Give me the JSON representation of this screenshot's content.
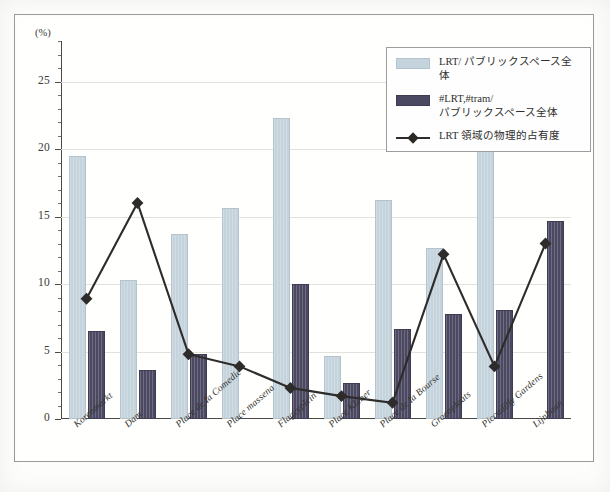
{
  "figure": {
    "y_unit_label": "(%)"
  },
  "legend": {
    "items": [
      {
        "key": "light-bar",
        "swatch": "light",
        "line1": "LRT/ パブリックスペース全体",
        "line2": ""
      },
      {
        "key": "dark-bar",
        "swatch": "dark",
        "line1": "#LRT,#tram/",
        "line2": "パブリックスペース全体"
      },
      {
        "key": "line-series",
        "swatch": "line",
        "line1": "LRT 領域の物理的占有度",
        "line2": ""
      }
    ]
  },
  "colors": {
    "light_bar": "#c5d3dc",
    "dark_bar": "#4b4861",
    "line": "#2e2c2a",
    "grid": "#e2e2dc",
    "axis": "#4a4a48",
    "frame": "#9a9a96"
  },
  "chart_data": {
    "type": "bar",
    "title": "",
    "xlabel": "",
    "ylabel": "(%)",
    "ylim": [
      0,
      28
    ],
    "yticks": [
      0,
      5,
      10,
      15,
      20,
      25
    ],
    "grid": true,
    "legend_position": "top-right",
    "categories": [
      "Korenmarkt",
      "Dam",
      "Place de la Comedie",
      "Place massena",
      "Flageyplein",
      "Place Kleber",
      "Place de la Bourse",
      "Groenplaats",
      "Piccadilly Gardens",
      "Lijnbaan"
    ],
    "series": [
      {
        "name": "LRT/ パブリックスペース全体",
        "type": "bar",
        "color": "#c5d3dc",
        "values": [
          19.5,
          10.3,
          13.7,
          15.6,
          22.3,
          4.7,
          16.2,
          12.7,
          24.2,
          0.0
        ]
      },
      {
        "name": "#LRT,#tram/ パブリックスペース全体",
        "type": "bar",
        "color": "#4b4861",
        "values": [
          6.5,
          3.6,
          4.8,
          0.0,
          10.0,
          2.7,
          6.7,
          7.8,
          8.1,
          14.7
        ]
      },
      {
        "name": "LRT 領域の物理的占有度",
        "type": "line",
        "color": "#2e2c2a",
        "marker": "diamond",
        "values": [
          8.9,
          16.0,
          4.8,
          3.9,
          2.3,
          1.7,
          1.2,
          12.2,
          3.9,
          13.0
        ]
      }
    ]
  }
}
